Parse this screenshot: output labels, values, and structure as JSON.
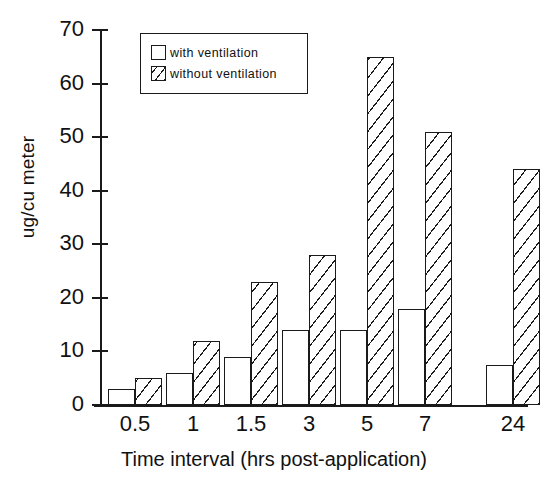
{
  "chart_data": {
    "type": "bar",
    "title": "",
    "xlabel": "Time interval (hrs post-application)",
    "ylabel": "ug/cu meter",
    "categories": [
      "0.5",
      "1",
      "1.5",
      "3",
      "5",
      "7",
      "24"
    ],
    "ylim": [
      0,
      70
    ],
    "yticks": [
      0,
      10,
      20,
      30,
      40,
      50,
      60,
      70
    ],
    "grid": false,
    "legend_position": "top-left-inside",
    "series": [
      {
        "name": "with ventilation",
        "fill": "empty",
        "values": [
          3,
          6,
          9,
          14,
          14,
          18,
          7.5
        ]
      },
      {
        "name": "without ventilation",
        "fill": "hatched",
        "values": [
          5,
          12,
          23,
          28,
          65,
          51,
          44
        ]
      }
    ]
  },
  "legend": {
    "items": [
      {
        "label": "with ventilation",
        "swatch": "empty-box-icon"
      },
      {
        "label": "without ventilation",
        "swatch": "hatched-box-icon"
      }
    ]
  },
  "axes": {
    "y_tick_labels": [
      "70",
      "60",
      "50",
      "40",
      "30",
      "20",
      "10",
      "0"
    ],
    "x_tick_labels": [
      "0.5",
      "1",
      "1.5",
      "3",
      "5",
      "7",
      "24"
    ]
  },
  "colors": {
    "ink": "#1a1a1a",
    "background": "#ffffff"
  }
}
